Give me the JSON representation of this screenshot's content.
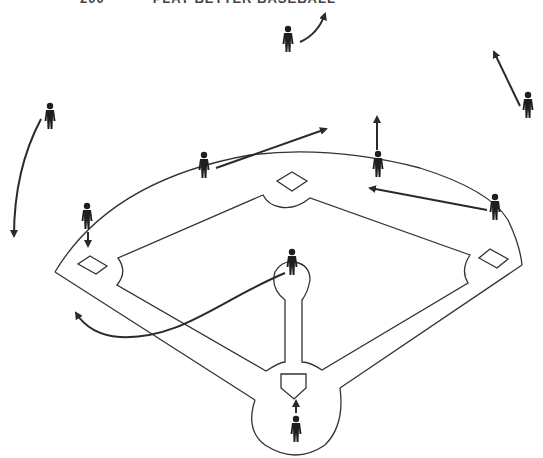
{
  "header": {
    "page_number": "200",
    "running_title": "PLAY BETTER BASEBALL"
  },
  "diagram": {
    "colors": {
      "line": "#333333",
      "player": "#1e1e1e",
      "arrow": "#2a2a2a",
      "background": "#ffffff"
    },
    "players": [
      {
        "id": "center-fielder-deep",
        "x": 288,
        "y": 40
      },
      {
        "id": "left-fielder",
        "x": 50,
        "y": 117
      },
      {
        "id": "right-fielder",
        "x": 528,
        "y": 106
      },
      {
        "id": "shortstop",
        "x": 204,
        "y": 166
      },
      {
        "id": "second-baseman",
        "x": 378,
        "y": 165
      },
      {
        "id": "first-baseman",
        "x": 495,
        "y": 208
      },
      {
        "id": "third-baseman",
        "x": 87,
        "y": 217
      },
      {
        "id": "pitcher",
        "x": 292,
        "y": 263
      },
      {
        "id": "catcher",
        "x": 296,
        "y": 430
      }
    ],
    "movements": [
      {
        "from": "center-fielder-deep",
        "path": "M300 42 Q318 34 325 14",
        "type": "curve"
      },
      {
        "from": "left-fielder",
        "path": "M41 119 Q14 170 14 236",
        "type": "curve"
      },
      {
        "from": "right-fielder",
        "path": "M520 106 L494 52",
        "type": "straight"
      },
      {
        "from": "shortstop",
        "path": "M216 168 L326 129",
        "type": "straight"
      },
      {
        "from": "second-baseman",
        "path": "M377 150 L377 117",
        "type": "straight"
      },
      {
        "from": "first-baseman",
        "path": "M487 210 L370 188",
        "type": "straight"
      },
      {
        "from": "third-baseman",
        "path": "M88 232 L88 246",
        "type": "straight"
      },
      {
        "from": "pitcher",
        "path": "M285 273 C220 300 180 340 120 337 Q90 335 76 313",
        "type": "curve"
      },
      {
        "from": "catcher",
        "path": "M296 413 L296 401",
        "type": "straight"
      }
    ],
    "bases": [
      "first-base",
      "second-base",
      "third-base",
      "home-plate"
    ]
  }
}
